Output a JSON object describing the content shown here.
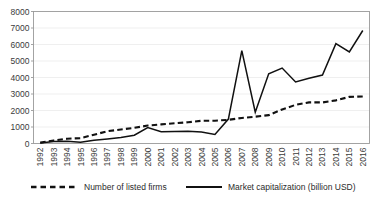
{
  "chart_data": {
    "type": "line",
    "title": "",
    "subtitle": "",
    "xlabel": "",
    "ylabel": "",
    "ylim": [
      0,
      8000
    ],
    "ytick_step": 1000,
    "yticks": [
      "0",
      "1000",
      "2000",
      "3000",
      "4000",
      "5000",
      "6000",
      "7000",
      "8000"
    ],
    "grid": true,
    "grid_axis": "y",
    "legend_position": "bottom",
    "categories": [
      "1992",
      "1993",
      "1994",
      "1995",
      "1996",
      "1997",
      "1998",
      "1999",
      "2000",
      "2001",
      "2002",
      "2003",
      "2004",
      "2005",
      "2006",
      "2007",
      "2008",
      "2009",
      "2010",
      "2011",
      "2012",
      "2013",
      "2014",
      "2015",
      "2016"
    ],
    "series": [
      {
        "name": "Number of listed firms",
        "style": "dashed",
        "color": "#111111",
        "values": [
          53,
          183,
          291,
          323,
          530,
          745,
          851,
          949,
          1088,
          1160,
          1224,
          1287,
          1377,
          1381,
          1434,
          1550,
          1625,
          1718,
          2063,
          2342,
          2494,
          2489,
          2613,
          2827,
          2850
        ]
      },
      {
        "name": "Market capitalization (billion USD)",
        "style": "solid",
        "color": "#111111",
        "values": [
          30,
          125,
          130,
          75,
          200,
          280,
          360,
          500,
          970,
          715,
          730,
          740,
          700,
          545,
          1480,
          5630,
          1900,
          4230,
          4570,
          3730,
          3950,
          4150,
          6050,
          5550,
          6850
        ]
      }
    ]
  },
  "legend": {
    "items": [
      {
        "label": "Number of listed firms",
        "style": "dashed"
      },
      {
        "label": "Market capitalization (billion USD)",
        "style": "solid"
      }
    ]
  }
}
